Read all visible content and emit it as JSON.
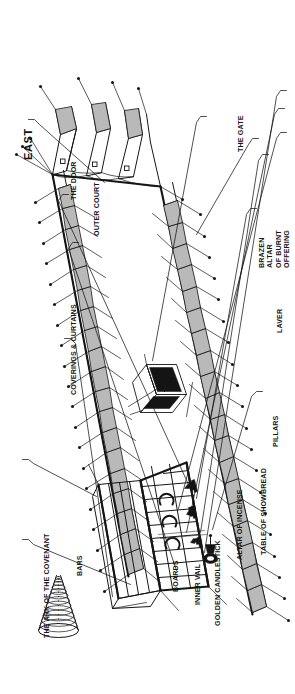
{
  "figure": {
    "type": "line-drawing",
    "orientation": "artwork rotated 90 degrees counter-clockwise on a portrait page",
    "ink_color": "#161616",
    "background_color": "#ffffff"
  },
  "compass": {
    "label": "EAST",
    "icon": "arrow-icon",
    "direction": "up"
  },
  "labels": [
    {
      "id": "the-door",
      "text": "THE DOOR"
    },
    {
      "id": "outer-court",
      "text": "OUTER COURT"
    },
    {
      "id": "the-gate",
      "text": "THE GATE"
    },
    {
      "id": "brazen-altar",
      "text": "BRAZEN ALTAR\nOF BURNT OFFERING"
    },
    {
      "id": "laver",
      "text": "LAVER"
    },
    {
      "id": "coverings-and-curtains",
      "text": "COVERINGS & CURTAINS"
    },
    {
      "id": "pillars",
      "text": "PILLARS"
    },
    {
      "id": "table-of-showbread",
      "text": "TABLE OF SHOWBREAD"
    },
    {
      "id": "altar-of-incense",
      "text": "ALTAR OF INCENSE"
    },
    {
      "id": "golden-candlestick",
      "text": "GOLDEN CANDLESTICK"
    },
    {
      "id": "inner-vail",
      "text": "INNER VAIL"
    },
    {
      "id": "boards",
      "text": "BOARDS"
    },
    {
      "id": "bars",
      "text": "BARS"
    },
    {
      "id": "ark-of-the-covenant",
      "text": "THE ARK OF THE COVENANT"
    }
  ],
  "objects": [
    {
      "id": "pillar-of-cloud",
      "name": "cone-spiral-cloud-icon"
    },
    {
      "id": "brazen-altar-object",
      "name": "altar-box-icon"
    },
    {
      "id": "laver-object",
      "name": "laver-basin-icon"
    },
    {
      "id": "tabernacle-tent",
      "name": "tent-structure"
    },
    {
      "id": "court-fence",
      "name": "court-fence-pillars-and-cords"
    }
  ]
}
